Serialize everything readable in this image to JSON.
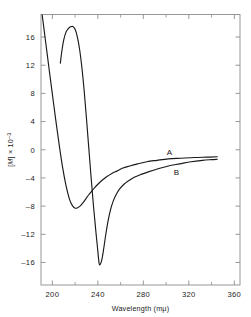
{
  "figure": {
    "background": "#ffffff",
    "line_color": "#1a1a1a",
    "axis_color": "#8d8d8d"
  },
  "axes": {
    "x": {
      "title_main": "Wavelength (m",
      "title_unit": "μ",
      "title_close": ")",
      "title_full": "Wavelength (mμ)",
      "min": 190,
      "max": 365,
      "major_ticks": [
        200,
        240,
        280,
        320,
        360
      ],
      "major_tick_labels": [
        "200",
        "240",
        "280",
        "320",
        "360"
      ],
      "minor_ticks": [
        220,
        260,
        300,
        340
      ]
    },
    "y": {
      "title_bracket_open": "[",
      "title_symbol": "M",
      "title_bracket_close": "]",
      "title_mult": " × 10",
      "title_exponent": "–3",
      "title_full": "[M] × 10⁻³",
      "min": -19.2,
      "max": 19.2,
      "major_ticks": [
        16,
        12,
        8,
        4,
        0,
        -4,
        -8,
        -12,
        -16
      ],
      "major_tick_labels": [
        "16",
        "12",
        "8",
        "4",
        "0",
        "–4",
        "–8",
        "–12",
        "–16"
      ]
    }
  },
  "curve_labels": [
    {
      "text": "A",
      "x": 303,
      "y": -0.7
    },
    {
      "text": "B",
      "x": 309,
      "y": -3.6
    }
  ],
  "chart_data": {
    "type": "line",
    "title": "",
    "xlabel": "Wavelength (mμ)",
    "ylabel": "[M] × 10⁻³",
    "xlim": [
      190,
      365
    ],
    "ylim": [
      -19.2,
      19.2
    ],
    "grid": false,
    "legend": "inline-curve-labels",
    "xticks": [
      200,
      240,
      280,
      320,
      360
    ],
    "yticks": [
      16,
      12,
      8,
      4,
      0,
      -4,
      -8,
      -12,
      -16
    ],
    "series": [
      {
        "name": "A",
        "label_position": {
          "x": 303,
          "y": -0.7
        },
        "points": [
          [
            191.0,
            19.2
          ],
          [
            194.0,
            15.4
          ],
          [
            197.0,
            11.6
          ],
          [
            200.0,
            7.9
          ],
          [
            203.0,
            4.2
          ],
          [
            206.0,
            0.7
          ],
          [
            209.0,
            -2.5
          ],
          [
            212.0,
            -5.1
          ],
          [
            215.0,
            -7.0
          ],
          [
            217.5,
            -7.9
          ],
          [
            220.0,
            -8.3
          ],
          [
            222.5,
            -8.2
          ],
          [
            225.0,
            -7.9
          ],
          [
            228.0,
            -7.3
          ],
          [
            231.0,
            -6.6
          ],
          [
            234.0,
            -6.0
          ],
          [
            237.0,
            -5.4
          ],
          [
            240.0,
            -4.9
          ],
          [
            244.0,
            -4.3
          ],
          [
            248.0,
            -3.8
          ],
          [
            252.0,
            -3.4
          ],
          [
            257.0,
            -3.0
          ],
          [
            262.0,
            -2.6
          ],
          [
            268.0,
            -2.3
          ],
          [
            275.0,
            -2.0
          ],
          [
            283.0,
            -1.7
          ],
          [
            292.0,
            -1.5
          ],
          [
            302.0,
            -1.3
          ],
          [
            313.0,
            -1.2
          ],
          [
            325.0,
            -1.1
          ],
          [
            336.0,
            -1.05
          ],
          [
            345.0,
            -1.0
          ]
        ]
      },
      {
        "name": "B",
        "label_position": {
          "x": 309,
          "y": -3.6
        },
        "points": [
          [
            207.0,
            12.3
          ],
          [
            208.5,
            14.2
          ],
          [
            210.0,
            15.6
          ],
          [
            212.0,
            16.7
          ],
          [
            214.0,
            17.2
          ],
          [
            216.0,
            17.45
          ],
          [
            218.0,
            17.5
          ],
          [
            220.0,
            17.1
          ],
          [
            222.0,
            16.0
          ],
          [
            224.0,
            14.2
          ],
          [
            226.0,
            11.6
          ],
          [
            228.0,
            8.3
          ],
          [
            230.0,
            4.4
          ],
          [
            232.0,
            0.3
          ],
          [
            234.0,
            -3.8
          ],
          [
            236.0,
            -7.7
          ],
          [
            238.0,
            -11.2
          ],
          [
            239.5,
            -13.6
          ],
          [
            241.0,
            -16.0
          ],
          [
            242.0,
            -16.3
          ],
          [
            243.5,
            -15.6
          ],
          [
            245.0,
            -14.2
          ],
          [
            247.0,
            -12.0
          ],
          [
            249.0,
            -10.1
          ],
          [
            251.0,
            -8.6
          ],
          [
            253.5,
            -7.3
          ],
          [
            256.0,
            -6.4
          ],
          [
            259.0,
            -5.6
          ],
          [
            263.0,
            -4.9
          ],
          [
            267.0,
            -4.4
          ],
          [
            272.0,
            -3.9
          ],
          [
            278.0,
            -3.5
          ],
          [
            285.0,
            -3.1
          ],
          [
            293.0,
            -2.7
          ],
          [
            302.0,
            -2.3
          ],
          [
            312.0,
            -2.0
          ],
          [
            322.0,
            -1.7
          ],
          [
            332.0,
            -1.5
          ],
          [
            340.0,
            -1.4
          ],
          [
            345.0,
            -1.35
          ]
        ]
      }
    ]
  }
}
